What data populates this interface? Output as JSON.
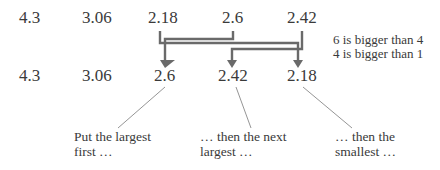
{
  "diagram": {
    "row_before": [
      "4.3",
      "3.06",
      "2.18",
      "2.6",
      "2.42"
    ],
    "row_after": [
      "4.3",
      "3.06",
      "2.6",
      "2.42",
      "2.18"
    ],
    "notes": [
      "6 is bigger than 4",
      "4 is bigger than 1"
    ],
    "captions": [
      {
        "line1": "Put the largest",
        "line2": "first …"
      },
      {
        "line1": "… then the next",
        "line2": "largest …"
      },
      {
        "line1": "… then the",
        "line2": "smallest …"
      }
    ],
    "colors": {
      "arrow": "#6a6a6a",
      "text": "#3a3a3a",
      "leader": "#7a7a7a"
    }
  }
}
